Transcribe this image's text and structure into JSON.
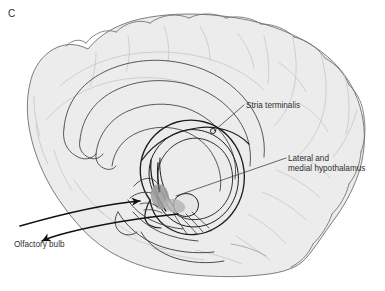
{
  "figure": {
    "panel_letter": "C",
    "type": "mid-sagittal brain diagram",
    "background_color": "#ffffff"
  },
  "labels": {
    "stria_terminalis": "Stria terminalis",
    "hypothalamus_line1": "Lateral and",
    "hypothalamus_line2": "medial hypothalamus",
    "olfactory_bulb": "Olfactory bulb"
  },
  "colors": {
    "brain_fill": "#ececec",
    "brain_outline": "#6f6f6f",
    "sulci": "#c9c9c9",
    "tract_stroke": "#2a2a2a",
    "hypothalamus_shade": "#9a9a9a",
    "text": "#2f2f31",
    "leader_line": "#3a3a3a"
  },
  "structures": [
    "cerebral cortex",
    "cingulate gyrus",
    "corpus callosum",
    "fornix",
    "stria terminalis",
    "amygdala",
    "hypothalamus",
    "temporal lobe",
    "brainstem",
    "olfactory tract"
  ]
}
